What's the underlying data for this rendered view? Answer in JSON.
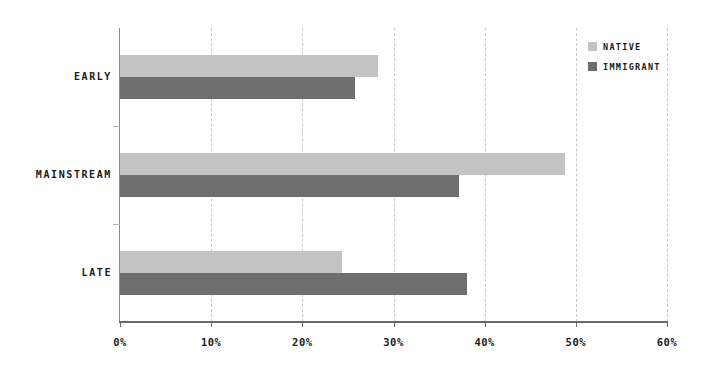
{
  "chart_data": {
    "type": "bar",
    "orientation": "horizontal",
    "title": "",
    "xlabel": "",
    "ylabel": "",
    "categories": [
      "EARLY",
      "MAINSTREAM",
      "LATE"
    ],
    "series": [
      {
        "name": "NATIVE",
        "color": "#c3c3c3",
        "values": [
          28.3,
          48.8,
          24.4
        ]
      },
      {
        "name": "IMMIGRANT",
        "color": "#6e6e6e",
        "values": [
          25.8,
          37.2,
          38.1
        ]
      }
    ],
    "xlim": [
      0,
      60
    ],
    "xticks": [
      0,
      10,
      20,
      30,
      40,
      50,
      60
    ],
    "xtick_labels": [
      "0%",
      "10%",
      "20%",
      "30%",
      "40%",
      "50%",
      "60%"
    ],
    "grid": "vertical-dashed",
    "legend_position": "top-right",
    "background": "#ffffff",
    "axis_color": "#6a6a6a",
    "gridline_color": "#c9c9c9"
  },
  "legend": {
    "items": [
      {
        "label": "NATIVE",
        "color": "#c3c3c3"
      },
      {
        "label": "IMMIGRANT",
        "color": "#6e6e6e"
      }
    ]
  }
}
